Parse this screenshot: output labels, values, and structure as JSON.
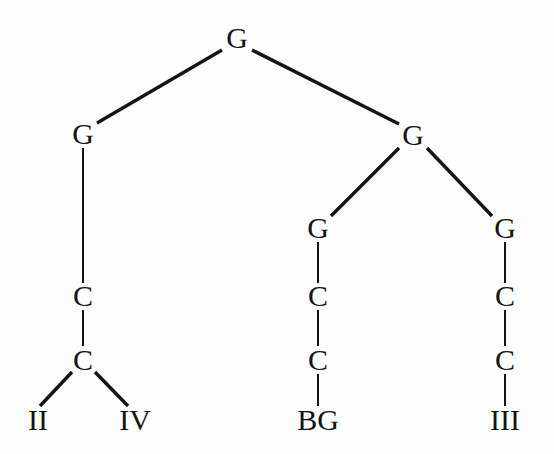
{
  "figure": {
    "kind": "phylogenetic-tree-diagram",
    "background_color": "#fdfdfd",
    "ink_color": "#141414",
    "width": 554,
    "height": 454
  },
  "tree": {
    "nodes": [
      {
        "id": "root",
        "label": "G",
        "x": 237,
        "y": 38,
        "level": 0,
        "kind": "internal"
      },
      {
        "id": "l1",
        "label": "G",
        "x": 83,
        "y": 134,
        "level": 1,
        "kind": "internal"
      },
      {
        "id": "r1",
        "label": "G",
        "x": 413,
        "y": 135,
        "level": 1,
        "kind": "internal"
      },
      {
        "id": "r2a",
        "label": "G",
        "x": 318,
        "y": 228,
        "level": 2,
        "kind": "internal"
      },
      {
        "id": "r2b",
        "label": "G",
        "x": 505,
        "y": 228,
        "level": 2,
        "kind": "internal"
      },
      {
        "id": "lC1",
        "label": "C",
        "x": 83,
        "y": 296,
        "level": 3,
        "kind": "internal"
      },
      {
        "id": "mC1",
        "label": "C",
        "x": 318,
        "y": 296,
        "level": 3,
        "kind": "internal"
      },
      {
        "id": "rC1",
        "label": "C",
        "x": 505,
        "y": 296,
        "level": 3,
        "kind": "internal"
      },
      {
        "id": "lC2",
        "label": "C",
        "x": 83,
        "y": 360,
        "level": 4,
        "kind": "internal"
      },
      {
        "id": "mC2",
        "label": "C",
        "x": 318,
        "y": 360,
        "level": 4,
        "kind": "internal"
      },
      {
        "id": "rC2",
        "label": "C",
        "x": 505,
        "y": 360,
        "level": 4,
        "kind": "internal"
      },
      {
        "id": "leaf-ii",
        "label": "II",
        "x": 38,
        "y": 420,
        "level": 5,
        "kind": "leaf"
      },
      {
        "id": "leaf-iv",
        "label": "IV",
        "x": 135,
        "y": 420,
        "level": 5,
        "kind": "leaf"
      },
      {
        "id": "leaf-bg",
        "label": "BG",
        "x": 318,
        "y": 420,
        "level": 5,
        "kind": "leaf"
      },
      {
        "id": "leaf-iii",
        "label": "III",
        "x": 505,
        "y": 420,
        "level": 5,
        "kind": "leaf"
      }
    ],
    "edges": [
      {
        "from": "root",
        "to": "l1",
        "x1": 222,
        "y1": 50,
        "x2": 97,
        "y2": 123,
        "style": "thick"
      },
      {
        "from": "root",
        "to": "r1",
        "x1": 252,
        "y1": 50,
        "x2": 399,
        "y2": 124,
        "style": "thick"
      },
      {
        "from": "l1",
        "to": "lC1",
        "x1": 83,
        "y1": 148,
        "x2": 83,
        "y2": 283,
        "style": "thin"
      },
      {
        "from": "r1",
        "to": "r2a",
        "x1": 399,
        "y1": 148,
        "x2": 331,
        "y2": 216,
        "style": "thick"
      },
      {
        "from": "r1",
        "to": "r2b",
        "x1": 427,
        "y1": 148,
        "x2": 492,
        "y2": 216,
        "style": "thick"
      },
      {
        "from": "r2a",
        "to": "mC1",
        "x1": 318,
        "y1": 242,
        "x2": 318,
        "y2": 283,
        "style": "thin"
      },
      {
        "from": "r2b",
        "to": "rC1",
        "x1": 505,
        "y1": 242,
        "x2": 505,
        "y2": 283,
        "style": "thin"
      },
      {
        "from": "lC1",
        "to": "lC2",
        "x1": 83,
        "y1": 310,
        "x2": 83,
        "y2": 346,
        "style": "thin"
      },
      {
        "from": "mC1",
        "to": "mC2",
        "x1": 318,
        "y1": 310,
        "x2": 318,
        "y2": 346,
        "style": "thin"
      },
      {
        "from": "rC1",
        "to": "rC2",
        "x1": 505,
        "y1": 310,
        "x2": 505,
        "y2": 346,
        "style": "thin"
      },
      {
        "from": "lC2",
        "to": "leaf-ii",
        "x1": 72,
        "y1": 372,
        "x2": 40,
        "y2": 406,
        "style": "thick"
      },
      {
        "from": "lC2",
        "to": "leaf-iv",
        "x1": 95,
        "y1": 372,
        "x2": 128,
        "y2": 406,
        "style": "thick"
      },
      {
        "from": "mC2",
        "to": "leaf-bg",
        "x1": 318,
        "y1": 374,
        "x2": 318,
        "y2": 406,
        "style": "thin"
      },
      {
        "from": "rC2",
        "to": "leaf-iii",
        "x1": 505,
        "y1": 374,
        "x2": 505,
        "y2": 406,
        "style": "thin"
      }
    ],
    "line_widths": {
      "thick": 3.4,
      "thin": 2.0
    }
  }
}
